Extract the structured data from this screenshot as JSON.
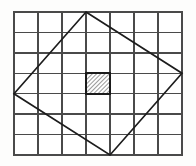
{
  "figure": {
    "type": "geometry-diagram",
    "canvas": {
      "width": 196,
      "height": 166,
      "background": "#fdfdfc"
    },
    "grid": {
      "name": "unit-grid",
      "columns": 7,
      "rows": 7,
      "origin_x": 14,
      "origin_y": 12,
      "cell_width": 24,
      "cell_height": 20.43,
      "x_lines": [
        14,
        38,
        62,
        86,
        110,
        134,
        158,
        182
      ],
      "y_lines": [
        12,
        32.4,
        52.9,
        73.3,
        93.7,
        114.1,
        134.6,
        155
      ],
      "line_color": "#4a4a4a",
      "line_width": 1.6,
      "border_color": "#4a4a4a",
      "border_width": 2.0
    },
    "diamond": {
      "name": "inscribed-square",
      "label": "tilted square",
      "stroke_color": "#1c1c1c",
      "stroke_width": 1.7,
      "fill": "none",
      "vertices": [
        {
          "name": "top-vertex",
          "x": 86,
          "y": 12,
          "grid_col": 3,
          "grid_row": 0
        },
        {
          "name": "right-vertex",
          "x": 182,
          "y": 73.3,
          "grid_col": 7,
          "grid_row": 3
        },
        {
          "name": "bottom-vertex",
          "x": 110,
          "y": 155,
          "grid_col": 4,
          "grid_row": 7
        },
        {
          "name": "left-vertex",
          "x": 14,
          "y": 93.7,
          "grid_col": 0,
          "grid_row": 4
        }
      ],
      "points_attr": "86,12 182,73.3 110,155 14,93.7"
    },
    "shaded_cell": {
      "name": "hatched-unit-square",
      "grid_col": 3,
      "grid_row": 3,
      "x": 86,
      "y": 73.3,
      "width": 24,
      "height": 20.4,
      "fill_pattern": "diagonal-hatch",
      "hatch_direction": "bottom-left-to-top-right",
      "hatch_color": "#9a9a9a",
      "hatch_spacing": 3,
      "border_color": "#1a1a1a",
      "border_width": 2.0
    }
  }
}
